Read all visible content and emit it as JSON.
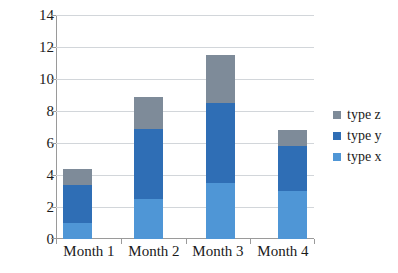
{
  "chart_data": {
    "type": "bar",
    "subtype": "stacked-column",
    "title": "",
    "xlabel": "",
    "ylabel": "",
    "categories": [
      "Month 1",
      "Month 2",
      "Month 3",
      "Month 4"
    ],
    "series": [
      {
        "name": "type x",
        "color": "#4f96d6",
        "values": [
          1.0,
          2.5,
          3.5,
          3.0
        ]
      },
      {
        "name": "type y",
        "color": "#2f6eb5",
        "values": [
          2.4,
          4.4,
          5.0,
          2.8
        ]
      },
      {
        "name": "type z",
        "color": "#7e8b99",
        "values": [
          1.0,
          2.0,
          3.0,
          1.0
        ]
      }
    ],
    "stack_totals": [
      4.4,
      8.9,
      11.5,
      6.8
    ],
    "ylim": [
      0,
      14
    ],
    "ytick_labels": [
      "0",
      "2",
      "4",
      "6",
      "8",
      "10",
      "12",
      "14"
    ],
    "ytick_values": [
      0,
      2,
      4,
      6,
      8,
      10,
      12,
      14
    ],
    "grid": true,
    "legend_position": "right",
    "legend_entries": [
      {
        "label": "type z",
        "color": "#7e8b99"
      },
      {
        "label": "type y",
        "color": "#2f6eb5"
      },
      {
        "label": "type x",
        "color": "#4f96d6"
      }
    ]
  },
  "caption": ""
}
